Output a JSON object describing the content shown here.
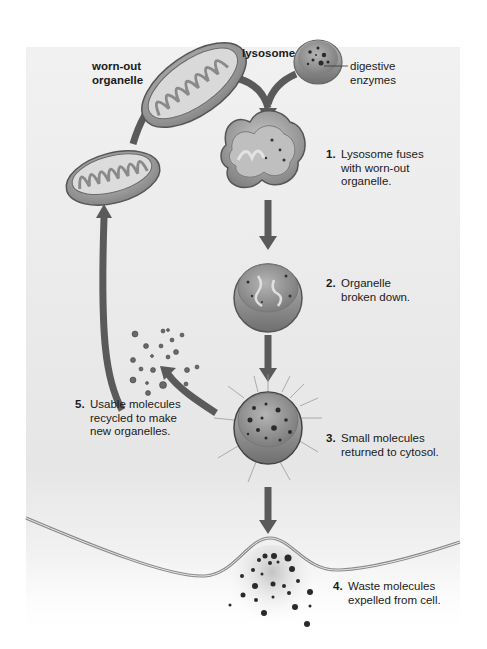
{
  "labels": {
    "worn_out_organelle": "worn-out\norganelle",
    "lysosome": "lysosome",
    "digestive_enzymes": "digestive\nenzymes"
  },
  "steps": [
    {
      "num": "1.",
      "text": "Lysosome fuses\nwith worn-out\norganelle."
    },
    {
      "num": "2.",
      "text": "Organelle\nbroken down."
    },
    {
      "num": "3.",
      "text": "Small molecules\nreturned to cytosol."
    },
    {
      "num": "4.",
      "text": "Waste molecules\nexpelled from cell."
    },
    {
      "num": "5.",
      "text": "Usable molecules\nrecycled to make\nnew organelles."
    }
  ],
  "colors": {
    "panel_background": "#ececec",
    "arrow": "#5a5a5a",
    "organelle_fill": "#9a9a9a",
    "text": "#1a1a1a"
  }
}
